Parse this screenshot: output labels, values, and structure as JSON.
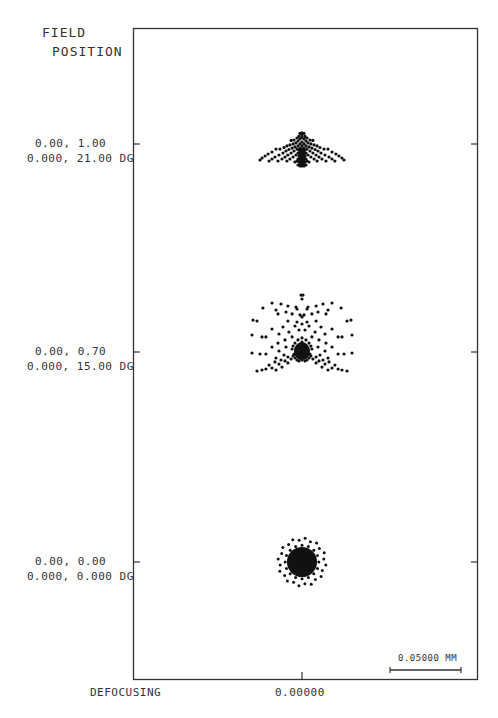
{
  "chart_data": {
    "type": "scatter",
    "header": [
      "FIELD",
      "POSITION"
    ],
    "xlabel": "DEFOCUSING",
    "x_tick_label": "0.00000",
    "scale_bar": {
      "value_mm": 0.05,
      "label": "0.05000 MM"
    },
    "units": "mm",
    "fields": [
      {
        "name": "field-1.00",
        "label_line1": "0.00, 1.00",
        "label_line2": "0.000, 21.00 DG",
        "rel_field": 1.0,
        "angle_deg": 21.0,
        "spots": [
          [
            0.0,
            0.0177
          ],
          [
            0.0014,
            0.0173
          ],
          [
            -0.0014,
            0.0173
          ],
          [
            0.0,
            0.0162
          ],
          [
            0.0021,
            0.0152
          ],
          [
            -0.0021,
            0.0152
          ],
          [
            0.0,
            0.0145
          ],
          [
            0.0035,
            0.0141
          ],
          [
            -0.0035,
            0.0141
          ],
          [
            0.0014,
            0.0134
          ],
          [
            -0.0014,
            0.0134
          ],
          [
            0.0056,
            0.0127
          ],
          [
            -0.0056,
            0.0127
          ],
          [
            0.0077,
            0.0124
          ],
          [
            -0.0077,
            0.0124
          ],
          [
            0.0028,
            0.012
          ],
          [
            -0.0028,
            0.012
          ],
          [
            0.0,
            0.0113
          ],
          [
            0.0042,
            0.0106
          ],
          [
            -0.0042,
            0.0106
          ],
          [
            0.0063,
            0.0099
          ],
          [
            -0.0063,
            0.0099
          ],
          [
            0.0014,
            0.0099
          ],
          [
            -0.0014,
            0.0099
          ],
          [
            0.0,
            0.0085
          ],
          [
            0.0028,
            0.0085
          ],
          [
            -0.0028,
            0.0085
          ],
          [
            0.0085,
            0.0092
          ],
          [
            -0.0085,
            0.0092
          ],
          [
            0.0106,
            0.0085
          ],
          [
            -0.0106,
            0.0085
          ],
          [
            0.0049,
            0.0078
          ],
          [
            -0.0049,
            0.0078
          ],
          [
            0.0014,
            0.007
          ],
          [
            -0.0014,
            0.007
          ],
          [
            0.0,
            0.0063
          ],
          [
            0.007,
            0.007
          ],
          [
            -0.007,
            0.007
          ],
          [
            0.0127,
            0.0074
          ],
          [
            -0.0127,
            0.0074
          ],
          [
            0.0035,
            0.0063
          ],
          [
            -0.0035,
            0.0063
          ],
          [
            0.0021,
            0.0056
          ],
          [
            -0.0021,
            0.0056
          ],
          [
            0.0,
            0.0049
          ],
          [
            0.0092,
            0.006
          ],
          [
            -0.0092,
            0.006
          ],
          [
            0.0155,
            0.0063
          ],
          [
            -0.0155,
            0.0063
          ],
          [
            0.0056,
            0.0049
          ],
          [
            -0.0056,
            0.0049
          ],
          [
            0.0014,
            0.0042
          ],
          [
            -0.0014,
            0.0042
          ],
          [
            0.0,
            0.0035
          ],
          [
            0.0113,
            0.0049
          ],
          [
            -0.0113,
            0.0049
          ],
          [
            0.0183,
            0.0063
          ],
          [
            -0.0183,
            0.0063
          ],
          [
            0.0028,
            0.0035
          ],
          [
            -0.0028,
            0.0035
          ],
          [
            0.0077,
            0.0035
          ],
          [
            -0.0077,
            0.0035
          ],
          [
            0.0014,
            0.0028
          ],
          [
            -0.0014,
            0.0028
          ],
          [
            0.0,
            0.0021
          ],
          [
            0.0021,
            0.0014
          ],
          [
            -0.0021,
            0.0014
          ],
          [
            0.0134,
            0.0035
          ],
          [
            -0.0134,
            0.0035
          ],
          [
            0.0211,
            0.0042
          ],
          [
            -0.0211,
            0.0042
          ],
          [
            0.0042,
            0.0021
          ],
          [
            -0.0042,
            0.0021
          ],
          [
            0.0099,
            0.0021
          ],
          [
            -0.0099,
            0.0021
          ],
          [
            0.0,
            0.0007
          ],
          [
            0.0014,
            0.0
          ],
          [
            -0.0014,
            0.0
          ],
          [
            0.0,
            -0.0007
          ],
          [
            0.0028,
            -0.0007
          ],
          [
            -0.0028,
            -0.0007
          ],
          [
            0.0162,
            0.0021
          ],
          [
            -0.0162,
            0.0021
          ],
          [
            0.0239,
            0.0028
          ],
          [
            -0.0239,
            0.0028
          ],
          [
            0.0063,
            0.0007
          ],
          [
            -0.0063,
            0.0007
          ],
          [
            0.012,
            0.0007
          ],
          [
            -0.012,
            0.0007
          ],
          [
            0.0014,
            -0.0014
          ],
          [
            -0.0014,
            -0.0014
          ],
          [
            0.0,
            -0.0021
          ],
          [
            0.0035,
            -0.0021
          ],
          [
            -0.0035,
            -0.0021
          ],
          [
            0.019,
            0.0007
          ],
          [
            -0.019,
            0.0007
          ],
          [
            0.026,
            0.0014
          ],
          [
            -0.026,
            0.0014
          ],
          [
            0.0085,
            -0.0007
          ],
          [
            -0.0085,
            -0.0007
          ],
          [
            0.0141,
            -0.0007
          ],
          [
            -0.0141,
            -0.0007
          ],
          [
            0.0021,
            -0.0028
          ],
          [
            -0.0021,
            -0.0028
          ],
          [
            0.0,
            -0.0035
          ],
          [
            0.0049,
            -0.0028
          ],
          [
            -0.0049,
            -0.0028
          ],
          [
            0.0211,
            -0.0007
          ],
          [
            -0.0211,
            -0.0007
          ],
          [
            0.0281,
            0.0
          ],
          [
            -0.0281,
            0.0
          ],
          [
            0.0106,
            -0.0021
          ],
          [
            -0.0106,
            -0.0021
          ],
          [
            0.0169,
            -0.0021
          ],
          [
            -0.0169,
            -0.0021
          ],
          [
            0.0014,
            -0.0042
          ],
          [
            -0.0014,
            -0.0042
          ],
          [
            0.0,
            -0.0049
          ],
          [
            0.0028,
            -0.0049
          ],
          [
            -0.0028,
            -0.0049
          ],
          [
            0.0232,
            -0.0021
          ],
          [
            -0.0232,
            -0.0021
          ],
          [
            0.0296,
            -0.0014
          ],
          [
            -0.0296,
            -0.0014
          ],
          [
            0.0,
            -0.0056
          ],
          [
            0.0014,
            -0.0056
          ],
          [
            -0.0014,
            -0.0056
          ],
          [
            0.0007,
            -0.0028
          ],
          [
            -0.0007,
            -0.0028
          ],
          [
            0.0007,
            -0.0042
          ],
          [
            -0.0007,
            -0.0042
          ],
          [
            0.0007,
            0.0014
          ],
          [
            -0.0007,
            0.0014
          ],
          [
            0.0007,
            0.0049
          ],
          [
            -0.0007,
            0.0049
          ]
        ]
      },
      {
        "name": "field-0.70",
        "label_line1": "0.00, 0.70",
        "label_line2": "0.000, 15.00 DG",
        "rel_field": 0.7,
        "angle_deg": 15.0,
        "spots": [
          [
            -0.0007,
            0.0401
          ],
          [
            0.0007,
            0.0401
          ],
          [
            0.0,
            0.0373
          ],
          [
            -0.0211,
            0.0345
          ],
          [
            0.0211,
            0.0345
          ],
          [
            -0.0148,
            0.0338
          ],
          [
            0.0148,
            0.0338
          ],
          [
            -0.0099,
            0.0324
          ],
          [
            0.0099,
            0.0324
          ],
          [
            -0.0042,
            0.0317
          ],
          [
            0.0042,
            0.0317
          ],
          [
            -0.0035,
            0.0303
          ],
          [
            0.0035,
            0.0303
          ],
          [
            -0.0275,
            0.031
          ],
          [
            0.0275,
            0.031
          ],
          [
            -0.0113,
            0.0282
          ],
          [
            0.0113,
            0.0282
          ],
          [
            -0.0183,
            0.0296
          ],
          [
            0.0183,
            0.0296
          ],
          [
            -0.0169,
            0.0268
          ],
          [
            0.0169,
            0.0268
          ],
          [
            -0.007,
            0.0268
          ],
          [
            0.007,
            0.0268
          ],
          [
            -0.0014,
            0.0261
          ],
          [
            0.0014,
            0.0261
          ],
          [
            0.0,
            0.0247
          ],
          [
            -0.0345,
            0.0225
          ],
          [
            0.0345,
            0.0225
          ],
          [
            -0.0317,
            0.0218
          ],
          [
            0.0317,
            0.0218
          ],
          [
            -0.0099,
            0.0218
          ],
          [
            0.0099,
            0.0218
          ],
          [
            -0.0035,
            0.0211
          ],
          [
            0.0035,
            0.0211
          ],
          [
            0.0,
            0.0197
          ],
          [
            -0.0049,
            0.0183
          ],
          [
            0.0049,
            0.0183
          ],
          [
            -0.0134,
            0.0176
          ],
          [
            0.0134,
            0.0176
          ],
          [
            -0.0211,
            0.0162
          ],
          [
            0.0211,
            0.0162
          ],
          [
            -0.0021,
            0.0155
          ],
          [
            0.0021,
            0.0155
          ],
          [
            -0.0092,
            0.0141
          ],
          [
            0.0092,
            0.0141
          ],
          [
            -0.0162,
            0.0127
          ],
          [
            0.0162,
            0.0127
          ],
          [
            -0.0352,
            0.012
          ],
          [
            0.0352,
            0.012
          ],
          [
            -0.0282,
            0.0106
          ],
          [
            0.0282,
            0.0106
          ],
          [
            -0.0254,
            0.0106
          ],
          [
            0.0254,
            0.0106
          ],
          [
            -0.007,
            0.0106
          ],
          [
            0.007,
            0.0106
          ],
          [
            -0.012,
            0.0085
          ],
          [
            0.012,
            0.0085
          ],
          [
            -0.0028,
            0.0085
          ],
          [
            0.0028,
            0.0085
          ],
          [
            0.0,
            0.0099
          ],
          [
            -0.0169,
            0.0063
          ],
          [
            0.0169,
            0.0063
          ],
          [
            -0.0049,
            0.0063
          ],
          [
            0.0049,
            0.0063
          ],
          [
            -0.0113,
            0.0035
          ],
          [
            0.0113,
            0.0035
          ],
          [
            -0.0211,
            0.0035
          ],
          [
            0.0211,
            0.0035
          ],
          [
            -0.0352,
            -0.0007
          ],
          [
            0.0352,
            -0.0007
          ],
          [
            -0.0296,
            -0.0014
          ],
          [
            0.0296,
            -0.0014
          ],
          [
            -0.0254,
            -0.0014
          ],
          [
            0.0254,
            -0.0014
          ],
          [
            -0.007,
            0.0021
          ],
          [
            0.007,
            0.0021
          ],
          [
            -0.0162,
            0.0007
          ],
          [
            0.0162,
            0.0007
          ],
          [
            -0.0127,
            -0.0021
          ],
          [
            0.0127,
            -0.0021
          ],
          [
            -0.0183,
            -0.0042
          ],
          [
            0.0183,
            -0.0042
          ],
          [
            -0.0099,
            -0.0035
          ],
          [
            0.0099,
            -0.0035
          ],
          [
            -0.0148,
            -0.0056
          ],
          [
            0.0148,
            -0.0056
          ],
          [
            -0.0077,
            -0.0049
          ],
          [
            0.0077,
            -0.0049
          ],
          [
            -0.019,
            -0.007
          ],
          [
            0.019,
            -0.007
          ],
          [
            -0.012,
            -0.0063
          ],
          [
            0.012,
            -0.0063
          ],
          [
            -0.0232,
            -0.0092
          ],
          [
            0.0232,
            -0.0092
          ],
          [
            -0.0162,
            -0.0085
          ],
          [
            0.0162,
            -0.0085
          ],
          [
            -0.0099,
            -0.0077
          ],
          [
            0.0099,
            -0.0077
          ],
          [
            -0.0141,
            -0.0106
          ],
          [
            0.0141,
            -0.0106
          ],
          [
            -0.0211,
            -0.0113
          ],
          [
            0.0211,
            -0.0113
          ],
          [
            -0.0282,
            -0.0127
          ],
          [
            0.0282,
            -0.0127
          ],
          [
            -0.0254,
            -0.012
          ],
          [
            0.0254,
            -0.012
          ],
          [
            -0.0183,
            -0.0127
          ],
          [
            0.0183,
            -0.0127
          ],
          [
            -0.0317,
            -0.0134
          ],
          [
            0.0317,
            -0.0134
          ],
          [
            0.0,
            0.007
          ],
          [
            0.0,
            0.0049
          ],
          [
            -0.0014,
            0.0049
          ],
          [
            0.0014,
            0.0049
          ],
          [
            0.0,
            0.0028
          ],
          [
            -0.0028,
            0.0028
          ],
          [
            0.0028,
            0.0028
          ],
          [
            -0.0014,
            0.0014
          ],
          [
            0.0014,
            0.0014
          ],
          [
            0.0,
            0.0007
          ],
          [
            -0.0042,
            0.0007
          ],
          [
            0.0042,
            0.0007
          ],
          [
            -0.0028,
            -0.0007
          ],
          [
            0.0028,
            -0.0007
          ],
          [
            0.0,
            -0.0014
          ],
          [
            -0.0056,
            -0.0014
          ],
          [
            0.0056,
            -0.0014
          ],
          [
            -0.0042,
            -0.0021
          ],
          [
            0.0042,
            -0.0021
          ],
          [
            -0.0014,
            -0.0021
          ],
          [
            0.0014,
            -0.0021
          ],
          [
            -0.0063,
            -0.0028
          ],
          [
            0.0063,
            -0.0028
          ],
          [
            -0.0028,
            -0.0035
          ],
          [
            0.0028,
            -0.0035
          ],
          [
            0.0,
            -0.0042
          ],
          [
            -0.0049,
            -0.0042
          ],
          [
            0.0049,
            -0.0042
          ],
          [
            -0.0014,
            -0.0042
          ],
          [
            0.0014,
            -0.0042
          ],
          [
            -0.0035,
            -0.0056
          ],
          [
            0.0035,
            -0.0056
          ],
          [
            0.0,
            -0.0056
          ],
          [
            -0.0021,
            -0.0063
          ],
          [
            0.0021,
            -0.0063
          ],
          [
            -0.0063,
            0.0042
          ],
          [
            0.0063,
            0.0042
          ],
          [
            -0.0021,
            0.0042
          ],
          [
            0.0021,
            0.0042
          ],
          [
            -0.0035,
            0.0014
          ],
          [
            0.0035,
            0.0014
          ],
          [
            -0.0007,
            -0.0007
          ],
          [
            0.0007,
            -0.0007
          ]
        ]
      },
      {
        "name": "field-0.00",
        "label_line1": "0.00, 0.00",
        "label_line2": "0.000, 0.000 DG",
        "rel_field": 0.0,
        "angle_deg": 0.0,
        "spots": "radially-symmetric: dense core radius 0.0106 mm with outer ring of 24 points at radius 0.0155–0.0169 mm"
      }
    ]
  }
}
